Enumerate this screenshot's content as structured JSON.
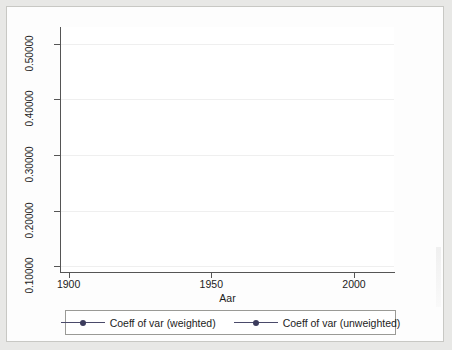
{
  "chart_data": {
    "type": "line",
    "title": "",
    "xlabel": "Aar",
    "ylabel": "",
    "xlim": [
      1897,
      2014
    ],
    "ylim": [
      0.09,
      0.53
    ],
    "grid": true,
    "legend_position": "bottom",
    "x_ticks": [
      1900,
      1950,
      2000
    ],
    "x_tick_labels": [
      "1900",
      "1950",
      "2000"
    ],
    "y_ticks": [
      0.1,
      0.2,
      0.3,
      0.4,
      0.5
    ],
    "y_tick_labels": [
      "0.10000",
      "0.20000",
      "0.30000",
      "0.40000",
      "0.50000"
    ],
    "x": [
      1900,
      1910,
      1920,
      1930,
      1940,
      1950,
      1960,
      1965,
      1970,
      1975,
      1980,
      1988,
      2000,
      2010
    ],
    "series": [
      {
        "name": "Coeff of var (weighted)",
        "color": "#3b3b5c",
        "marker": "circle",
        "values": [
          0.388,
          0.35,
          0.5,
          0.498,
          0.443,
          0.345,
          0.301,
          0.246,
          0.245,
          0.207,
          0.163,
          0.304,
          0.279,
          0.236
        ]
      },
      {
        "name": "Coeff of var (unweighted)",
        "color": "#3b3b5c",
        "marker": "circle",
        "values": [
          0.334,
          0.308,
          0.468,
          0.456,
          0.378,
          0.311,
          0.246,
          0.202,
          0.15,
          0.127,
          0.127,
          0.225,
          0.205,
          0.2
        ]
      }
    ]
  },
  "axis": {
    "x_title": "Aar"
  },
  "legend": {
    "entries": [
      {
        "label": "Coeff of var (weighted)"
      },
      {
        "label": "Coeff of var (unweighted)"
      }
    ]
  }
}
